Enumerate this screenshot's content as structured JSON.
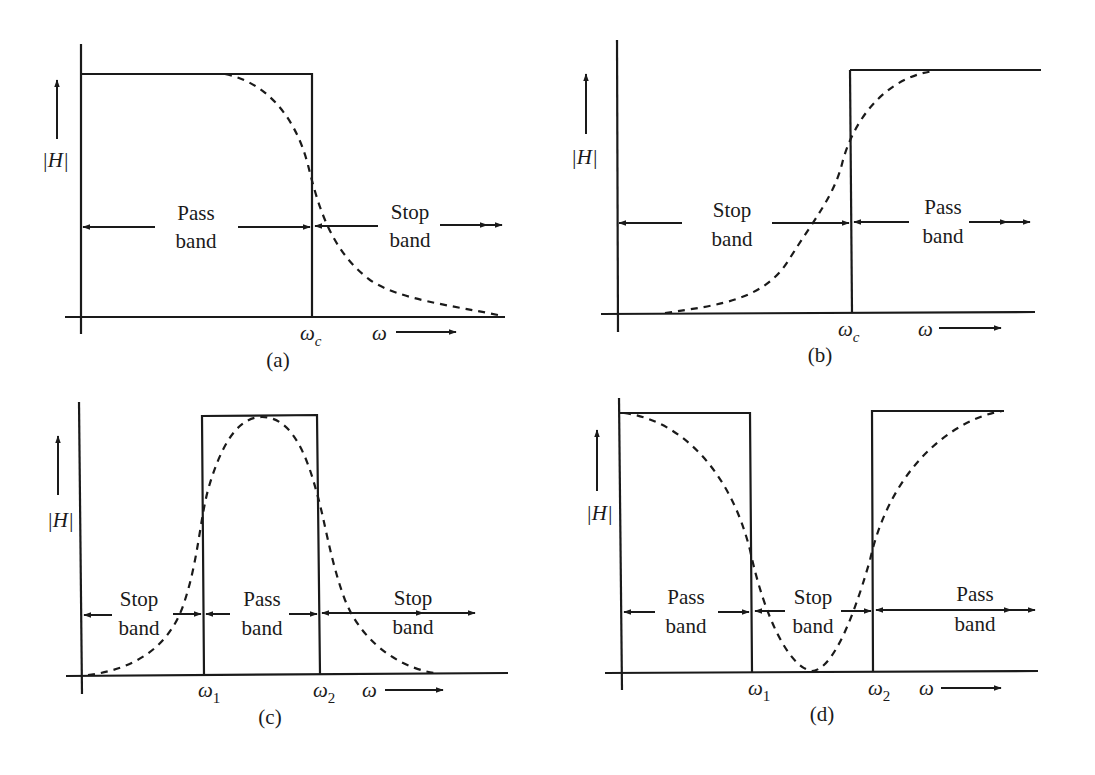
{
  "figure": {
    "colors": {
      "ink": "#1a1a1a",
      "background": "#ffffff"
    },
    "y_axis_label": "|H|",
    "x_axis_label": "ω",
    "panels": [
      {
        "id": "a",
        "caption": "(a)",
        "filter_type": "low-pass",
        "cutoff_labels": [
          "ωc"
        ],
        "band_labels": [
          {
            "line1": "Pass",
            "line2": "band"
          },
          {
            "line1": "Stop",
            "line2": "band"
          }
        ]
      },
      {
        "id": "b",
        "caption": "(b)",
        "filter_type": "high-pass",
        "cutoff_labels": [
          "ωc"
        ],
        "band_labels": [
          {
            "line1": "Stop",
            "line2": "band"
          },
          {
            "line1": "Pass",
            "line2": "band"
          }
        ]
      },
      {
        "id": "c",
        "caption": "(c)",
        "filter_type": "band-pass",
        "cutoff_labels": [
          "ω1",
          "ω2"
        ],
        "band_labels": [
          {
            "line1": "Stop",
            "line2": "band"
          },
          {
            "line1": "Pass",
            "line2": "band"
          },
          {
            "line1": "Stop",
            "line2": "band"
          }
        ]
      },
      {
        "id": "d",
        "caption": "(d)",
        "filter_type": "band-stop",
        "cutoff_labels": [
          "ω1",
          "ω2"
        ],
        "band_labels": [
          {
            "line1": "Pass",
            "line2": "band"
          },
          {
            "line1": "Stop",
            "line2": "band"
          },
          {
            "line1": "Pass",
            "line2": "band"
          }
        ]
      }
    ],
    "legend_semantics": {
      "solid": "ideal response",
      "dashed": "practical response"
    }
  }
}
